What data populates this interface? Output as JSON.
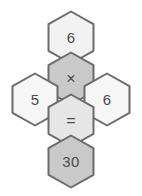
{
  "figure": {
    "name": "hexagon-equation-puzzle",
    "background_color": "#ffffff",
    "layout": "cross",
    "equation_text": "6 × 5 = 30",
    "stroke_color": "#6b6b6b",
    "text_color": "#4a4a4a"
  },
  "cells": [
    {
      "id": "top",
      "label": "6",
      "role": "operand",
      "fill": "#f2f2f2",
      "position": "top"
    },
    {
      "id": "center",
      "label": "×",
      "role": "operator",
      "icon": "multiply-icon",
      "fill": "#c9c9c9",
      "position": "center"
    },
    {
      "id": "left",
      "label": "5",
      "role": "operand",
      "fill": "#f6f6f6",
      "position": "left"
    },
    {
      "id": "right",
      "label": "6",
      "role": "operand",
      "fill": "#f6f6f6",
      "position": "right"
    },
    {
      "id": "equals",
      "label": "=",
      "role": "operator",
      "icon": "equals-icon",
      "fill": "#e6e6e6",
      "position": "eq"
    },
    {
      "id": "bottom",
      "label": "30",
      "role": "result",
      "fill": "#c9c9c9",
      "position": "bottom"
    }
  ]
}
